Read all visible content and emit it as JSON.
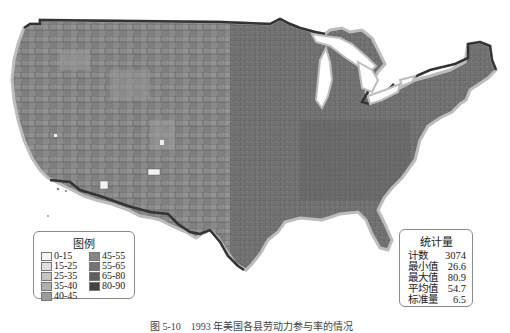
{
  "map": {
    "title": "US county choropleth map",
    "colors": {
      "land_fill": "#7d7d7d",
      "west_fill": "#8c8c8c",
      "east_fill": "#6a6a6a",
      "county_lines": "#555555",
      "border_dark": "#333333",
      "coast_light": "#b5b5b5",
      "lakes": "#ffffff"
    }
  },
  "legend": {
    "title": "图例",
    "items": [
      {
        "label": "0-15",
        "color": "#f4f4f4"
      },
      {
        "label": "15-25",
        "color": "#dedede"
      },
      {
        "label": "25-35",
        "color": "#c4c4c4"
      },
      {
        "label": "35-40",
        "color": "#b0b0b0"
      },
      {
        "label": "40-45",
        "color": "#9c9c9c"
      },
      {
        "label": "45-55",
        "color": "#888888"
      },
      {
        "label": "55-65",
        "color": "#747474"
      },
      {
        "label": "65-80",
        "color": "#5e5e5e"
      },
      {
        "label": "80-90",
        "color": "#444444"
      }
    ]
  },
  "stats": {
    "title": "统计量",
    "rows": [
      {
        "label": "计数",
        "value": "3074"
      },
      {
        "label": "最小值",
        "value": "26.6"
      },
      {
        "label": "最大值",
        "value": "80.9"
      },
      {
        "label": "平均值",
        "value": "54.7"
      },
      {
        "label": "标准量",
        "value": "6.5"
      }
    ]
  },
  "caption": "图 5-10　1993 年美国各县劳动力参与率的情况"
}
